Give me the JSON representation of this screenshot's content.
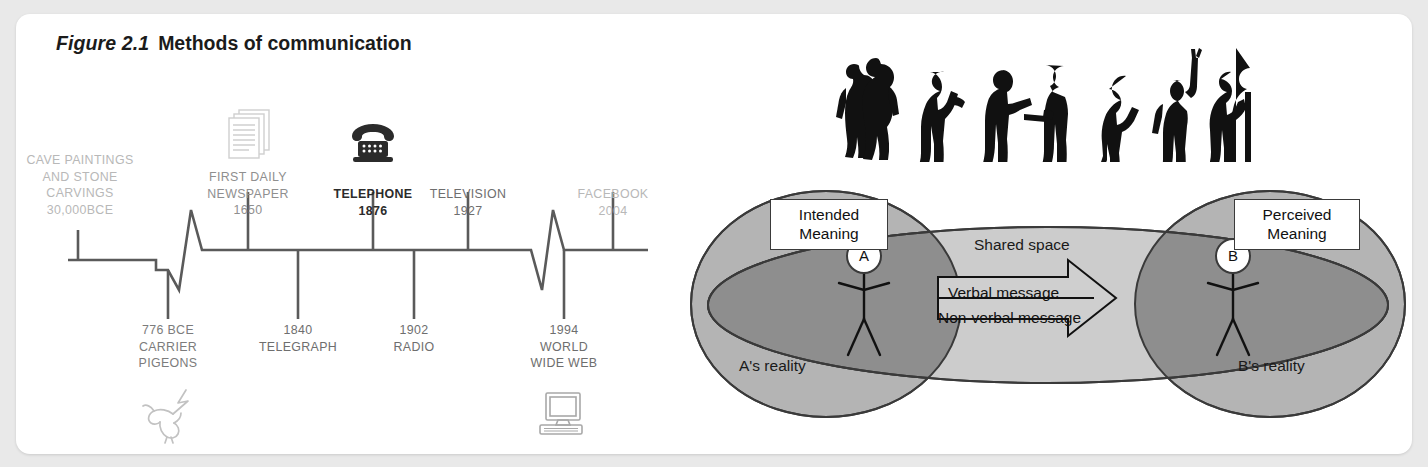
{
  "figure": {
    "number": "Figure 2.1",
    "caption": "Methods of communication"
  },
  "timeline": {
    "above_events": [
      {
        "text": "CAVE PAINTINGS\nAND STONE\nCARVINGS\n30,000BCE",
        "tone": "light",
        "icon": "none"
      },
      {
        "text": "FIRST DAILY\nNEWSPAPER\n1650",
        "tone": "mid",
        "icon": "newspaper-icon"
      },
      {
        "text": "TELEPHONE\n1876",
        "tone": "black",
        "icon": "telephone-icon"
      },
      {
        "text": "TELEVISION\n1927",
        "tone": "dark",
        "icon": "none"
      },
      {
        "text": "FACEBOOK\n2004",
        "tone": "light",
        "icon": "none"
      }
    ],
    "below_events": [
      {
        "text": "776 BCE\nCARRIER\nPIGEONS",
        "tone": "grey2",
        "icon": "dove-icon"
      },
      {
        "text": "1840\nTELEGRAPH",
        "tone": "dark",
        "icon": "none"
      },
      {
        "text": "1902\nRADIO",
        "tone": "dark",
        "icon": "none"
      },
      {
        "text": "1994\nWORLD\nWIDE WEB",
        "tone": "dark",
        "icon": "computer-icon"
      }
    ]
  },
  "diagram": {
    "a_reality_label": "A's reality",
    "b_reality_label": "B's reality",
    "shared_space_label": "Shared space",
    "intended_meaning_label": "Intended\nMeaning",
    "perceived_meaning_label": "Perceived\nMeaning",
    "node_a": "A",
    "node_b": "B",
    "verbal_message_label": "Verbal message",
    "nonverbal_message_label": "Non-verbal message",
    "silhouettes": [
      "hugging-pair-silhouette",
      "bowing-person-silhouette",
      "handshake-pair-silhouette",
      "bowing-woman-silhouette",
      "waving-person-silhouette",
      "embracing-pair-silhouette"
    ]
  },
  "colors": {
    "card_background": "#ffffff",
    "page_background": "#e9e9e9",
    "ellipse_light": "#b4b4b4",
    "ellipse_shared": "#c9c9c9",
    "ellipse_overlap": "#8e8e8e",
    "stroke": "#3a3a3a",
    "timeline_line": "#5a5a5a"
  }
}
